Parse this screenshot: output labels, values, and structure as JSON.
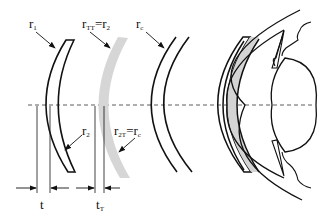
{
  "diagram": {
    "colors": {
      "stroke": "#111111",
      "gray_lens": "#d4d4d4",
      "axis": "#333333"
    },
    "labels": {
      "r1": {
        "base": "r",
        "sub": "1"
      },
      "rTT_eq_r2": {
        "base": "r",
        "sub": "TT",
        "eq": "=r",
        "sub2": "2"
      },
      "rc": {
        "base": "r",
        "sub": "c"
      },
      "r2": {
        "base": "r",
        "sub": "2"
      },
      "r2T_eq_rc": {
        "base": "r",
        "sub": "2T",
        "eq": "=r",
        "sub2": "c"
      },
      "t": {
        "base": "t"
      },
      "tT": {
        "base": "t",
        "sub": "T"
      }
    },
    "components": [
      {
        "id": "lens-1",
        "description": "meniscus lens with thickness t"
      },
      {
        "id": "lens-gray",
        "description": "gray thin shell lens with thickness tT"
      },
      {
        "id": "lens-3",
        "description": "two concentric arcs"
      },
      {
        "id": "eye",
        "description": "eye cross-section with gray lens on cornea"
      }
    ],
    "axis": "optical axis (dashed)"
  }
}
